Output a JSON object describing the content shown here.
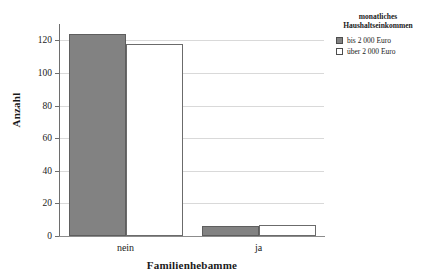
{
  "chart_data": {
    "type": "bar",
    "title": "",
    "xlabel": "Familienhebamme",
    "ylabel": "Anzahl",
    "categories": [
      "nein",
      "ja"
    ],
    "series": [
      {
        "name": "bis 2 000 Euro",
        "values": [
          124,
          6
        ],
        "color": "#828282"
      },
      {
        "name": "über 2 000 Euro",
        "values": [
          118,
          7
        ],
        "color": "#ffffff"
      }
    ],
    "ylim": [
      0,
      130
    ],
    "yticks": [
      0,
      20,
      40,
      60,
      80,
      100,
      120
    ],
    "ytick_labels": [
      "0",
      "20",
      "40",
      "60",
      "80",
      "100",
      "120"
    ],
    "grid": true,
    "grid_axis": "y",
    "legend": {
      "position": "right-top",
      "title": "monatliches Haushaltseinkommen",
      "title_line_1": "monatliches",
      "title_line_2": "Haushaltseinkommen",
      "entries": [
        "bis 2 000 Euro",
        "über 2 000 Euro"
      ]
    }
  }
}
